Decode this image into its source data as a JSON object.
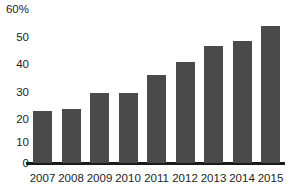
{
  "chart_data": {
    "type": "bar",
    "title": "",
    "xlabel": "",
    "ylabel": "",
    "categories": [
      "2007",
      "2008",
      "2009",
      "2010",
      "2011",
      "2012",
      "2013",
      "2014",
      "2015"
    ],
    "values": [
      20,
      21,
      27,
      27,
      34,
      39,
      45,
      47,
      53
    ],
    "ylim": [
      0,
      60
    ],
    "ytick_labels": [
      "0",
      "10",
      "20",
      "30",
      "40",
      "50",
      "60%"
    ],
    "ytick_values": [
      0,
      10,
      20,
      30,
      40,
      50,
      60
    ],
    "grid": false,
    "legend": null,
    "series": [
      {
        "name": "",
        "values": [
          20,
          21,
          27,
          27,
          34,
          39,
          45,
          47,
          53
        ]
      }
    ],
    "colors": {
      "bar": "#4a4a4a",
      "axis": "#1a1a1a",
      "text": "#1d1d1d",
      "background": "#ffffff"
    }
  }
}
